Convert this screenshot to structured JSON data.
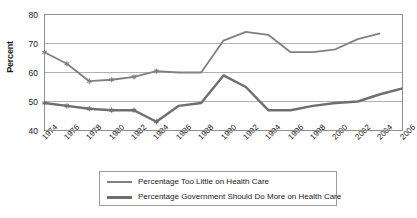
{
  "chart_data": {
    "type": "line",
    "title": "",
    "xlabel": "",
    "ylabel": "Percent",
    "ylim": [
      40,
      80
    ],
    "yticks": [
      40,
      50,
      60,
      70,
      80
    ],
    "grid": true,
    "legend_position": "bottom",
    "x": [
      1974,
      1976,
      1978,
      1980,
      1982,
      1984,
      1986,
      1988,
      1990,
      1992,
      1994,
      1996,
      1998,
      2000,
      2002,
      2004,
      2006
    ],
    "xtick_labels": [
      "1974",
      "1976",
      "1978",
      "1980",
      "1982",
      "1984",
      "1986",
      "1988",
      "1990",
      "1992",
      "1994",
      "1996",
      "1998",
      "2000",
      "2002",
      "2004",
      "2006"
    ],
    "series": [
      {
        "name": "Percentage Too Little on Health Care",
        "color": "#808080",
        "marker": "asterisk",
        "values": [
          67,
          63,
          57,
          57.5,
          58.5,
          60.5,
          60,
          60,
          71,
          74,
          73,
          67,
          67,
          68,
          71.5,
          73.5,
          null
        ]
      },
      {
        "name": "Percentage Government Should Do More on Health Care",
        "color": "#6e6e6e",
        "marker": "asterisk",
        "values": [
          49.5,
          48.5,
          47.5,
          47,
          47,
          43,
          48.5,
          49.5,
          59,
          55,
          47,
          47,
          48.5,
          49.5,
          50,
          52.5,
          54.5
        ]
      }
    ]
  },
  "axis": {
    "y_tick_labels": [
      "80",
      "70",
      "60",
      "50",
      "40"
    ],
    "y_title": "Percent"
  },
  "legend": {
    "entries": [
      {
        "label": "Percentage Too Little on Health Care"
      },
      {
        "label": "Percentage Government Should Do More on Health Care"
      }
    ]
  }
}
